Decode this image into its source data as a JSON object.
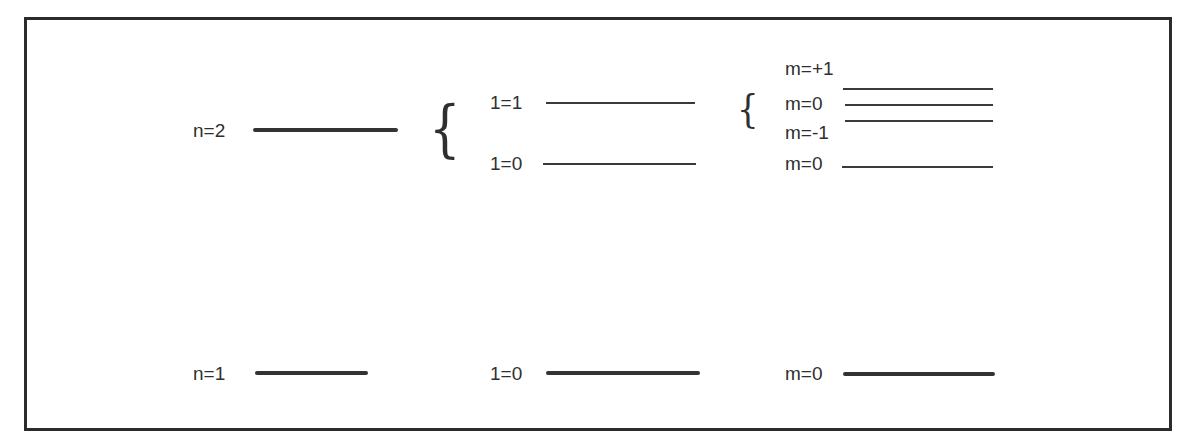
{
  "diagram": {
    "type": "energy-level-splitting",
    "columns": [
      {
        "name": "principal quantum number",
        "levels": [
          {
            "label": "n=2",
            "style": "thick"
          },
          {
            "label": "n=1",
            "style": "thick"
          }
        ]
      },
      {
        "name": "orbital quantum number",
        "levels": [
          {
            "label": "1=1",
            "parent": "n=2",
            "style": "thin"
          },
          {
            "label": "1=0",
            "parent": "n=2",
            "style": "thin"
          },
          {
            "label": "1=0",
            "parent": "n=1",
            "style": "thick"
          }
        ]
      },
      {
        "name": "magnetic quantum number",
        "levels": [
          {
            "label": "m=+1",
            "parent": "1=1",
            "style": "thin"
          },
          {
            "label": "m=0",
            "parent": "1=1",
            "style": "thin"
          },
          {
            "label": "m=-1",
            "parent": "1=1",
            "style": "thin"
          },
          {
            "label": "m=0",
            "parent": "1=0 (n=2)",
            "style": "thin"
          },
          {
            "label": "m=0",
            "parent": "1=0 (n=1)",
            "style": "thick"
          }
        ]
      }
    ],
    "braces": [
      "{",
      "{"
    ]
  },
  "labels": {
    "n2": "n=2",
    "n1": "n=1",
    "l1_n2": "1=1",
    "l0_n2": "1=0",
    "l0_n1": "1=0",
    "m_plus1": "m=+1",
    "m_0_a": "m=0",
    "m_minus1": "m=-1",
    "m_0_b": "m=0",
    "m_0_n1": "m=0",
    "brace_left": "{",
    "brace_right": "{"
  }
}
